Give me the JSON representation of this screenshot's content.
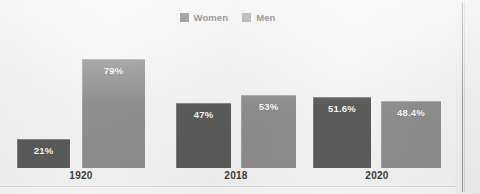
{
  "chart_data": {
    "type": "bar",
    "title": "",
    "subtitle": "",
    "xlabel": "",
    "ylabel": "",
    "ylim": [
      0,
      100
    ],
    "grid": false,
    "legend_position": "top-center",
    "value_suffix": "%",
    "categories": [
      "1920",
      "2018",
      "2020"
    ],
    "series": [
      {
        "name": "Women",
        "color": "#5c5c5c",
        "values": [
          21,
          47,
          51.6
        ],
        "labels": [
          "21%",
          "47%",
          "51.6%"
        ]
      },
      {
        "name": "Men",
        "color": "#8f8f8f",
        "values": [
          79,
          53,
          48.4
        ],
        "labels": [
          "79%",
          "53%",
          "48.4%"
        ]
      }
    ]
  },
  "legend": {
    "items": [
      {
        "label": "Women",
        "color": "#5c5c5c",
        "swatch_name": "legend-swatch-women"
      },
      {
        "label": "Men",
        "color": "#8f8f8f",
        "swatch_name": "legend-swatch-men"
      }
    ]
  },
  "axis": {
    "tick_labels": [
      "1920",
      "2018",
      "2020"
    ]
  },
  "bars": [
    {
      "group": "1920",
      "series": "Women",
      "label": "21%",
      "value": 21,
      "color": "#5c5c5c"
    },
    {
      "group": "1920",
      "series": "Men",
      "label": "79%",
      "value": 79,
      "color": "#8f8f8f"
    },
    {
      "group": "2018",
      "series": "Women",
      "label": "47%",
      "value": 47,
      "color": "#5c5c5c"
    },
    {
      "group": "2018",
      "series": "Men",
      "label": "53%",
      "value": 53,
      "color": "#8f8f8f"
    },
    {
      "group": "2020",
      "series": "Women",
      "label": "51.6%",
      "value": 51.6,
      "color": "#5c5c5c"
    },
    {
      "group": "2020",
      "series": "Men",
      "label": "48.4%",
      "value": 48.4,
      "color": "#8f8f8f"
    }
  ],
  "colors": {
    "women": "#5c5c5c",
    "men": "#8f8f8f",
    "background": "#f4f4f4",
    "panel": "#f6f6f6",
    "label_text": "#3c3c3c",
    "bar_label_text": "#ffffff",
    "rule": "#9b9b9b"
  }
}
